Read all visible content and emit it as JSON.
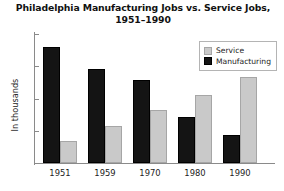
{
  "chart_data": {
    "type": "bar",
    "title": "Philadelphia Manufacturing Jobs vs. Service Jobs, 1951–1990",
    "title_line1": "Philadelphia Manufacturing Jobs vs. Service Jobs,",
    "title_line2": "1951–1990",
    "xlabel": "",
    "ylabel": "In thousands",
    "ylim": [
      0,
      400
    ],
    "yticks": [
      400,
      300,
      200,
      100,
      0
    ],
    "ytick_labels": [
      "400",
      "300",
      "200",
      "100",
      "0"
    ],
    "grid": false,
    "legend_position": "top-right",
    "categories": [
      "1951",
      "1959",
      "1970",
      "1980",
      "1990"
    ],
    "series": [
      {
        "name": "Manufacturing",
        "color": "#141414",
        "values": [
          360,
          293,
          257,
          142,
          87
        ]
      },
      {
        "name": "Service",
        "color": "#c9c9c9",
        "values": [
          68,
          115,
          165,
          210,
          266
        ]
      }
    ],
    "legend": [
      {
        "label": "Service",
        "swatch": "service"
      },
      {
        "label": "Manufacturing",
        "swatch": "manufacturing"
      }
    ]
  }
}
